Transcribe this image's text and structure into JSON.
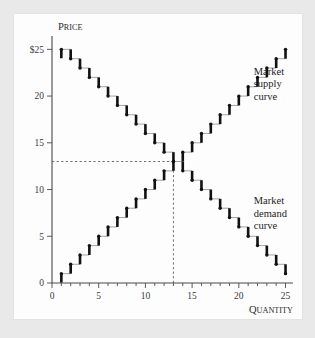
{
  "figure": {
    "background_color": "#e9e9e9",
    "panel_color": "#fdfdfd"
  },
  "axes": {
    "y_title": {
      "first_letter": "P",
      "rest": "RICE"
    },
    "x_title": {
      "first_letter": "Q",
      "rest": "UANTITY"
    },
    "x_ticklabels": [
      "0",
      "5",
      "10",
      "15",
      "20",
      "25"
    ],
    "x_tickvalues": [
      0,
      5,
      10,
      15,
      20,
      25
    ],
    "y_ticklabels": [
      "0",
      "5",
      "10",
      "15",
      "20",
      "$25"
    ],
    "y_tickvalues": [
      0,
      5,
      10,
      15,
      20,
      25
    ],
    "x_minor_step": 1,
    "xlim": [
      0,
      25.8
    ],
    "ylim": [
      0,
      26.0
    ]
  },
  "annotations": {
    "supply_label": [
      "Market",
      "supply",
      "curve"
    ],
    "demand_label": [
      "Market",
      "demand",
      "curve"
    ],
    "supply_label_q": 21.6,
    "supply_label_p": 22.3,
    "demand_label_q": 21.6,
    "demand_label_p": 8.4
  },
  "equilibrium": {
    "quantity": 13,
    "price": 13,
    "guide_color": "#555555"
  },
  "chart_data": {
    "type": "line",
    "title": "",
    "subtitle": "",
    "xlabel": "Quantity",
    "ylabel": "Price",
    "xlim": [
      0,
      25.8
    ],
    "ylim": [
      0,
      26.0
    ],
    "grid": false,
    "legend_position": "inline-annotation",
    "style": "step",
    "step_direction": "post-riser",
    "riser_color": "#111111",
    "tread_color": "#9a9a9a",
    "x_ticks": [
      0,
      1,
      2,
      3,
      4,
      5,
      6,
      7,
      8,
      9,
      10,
      11,
      12,
      13,
      14,
      15,
      16,
      17,
      18,
      19,
      20,
      21,
      22,
      23,
      24,
      25
    ],
    "x_ticklabels_shown": [
      0,
      5,
      10,
      15,
      20,
      25
    ],
    "y_ticks": [
      0,
      5,
      10,
      15,
      20,
      25
    ],
    "series": [
      {
        "name": "Market supply curve",
        "x": [
          1,
          2,
          3,
          4,
          5,
          6,
          7,
          8,
          9,
          10,
          11,
          12,
          13,
          14,
          15,
          16,
          17,
          18,
          19,
          20,
          21,
          22,
          23,
          24,
          25
        ],
        "values": [
          1,
          2,
          3,
          4,
          5,
          6,
          7,
          8,
          9,
          10,
          11,
          12,
          13,
          14,
          15,
          16,
          17,
          18,
          19,
          20,
          21,
          22,
          23,
          24,
          25
        ]
      },
      {
        "name": "Market demand curve",
        "x": [
          1,
          2,
          3,
          4,
          5,
          6,
          7,
          8,
          9,
          10,
          11,
          12,
          13,
          14,
          15,
          16,
          17,
          18,
          19,
          20,
          21,
          22,
          23,
          24,
          25
        ],
        "values": [
          25,
          24,
          23,
          22,
          21,
          20,
          19,
          18,
          17,
          16,
          15,
          14,
          13,
          12,
          11,
          10,
          9,
          8,
          7,
          6,
          5,
          4,
          3,
          2,
          1
        ]
      }
    ],
    "annotations": [
      {
        "text": "Market supply curve",
        "x": 21.6,
        "y": 22.3
      },
      {
        "text": "Market demand curve",
        "x": 21.6,
        "y": 8.4
      },
      {
        "text": "equilibrium guides",
        "x": 13,
        "y": 13
      }
    ]
  }
}
